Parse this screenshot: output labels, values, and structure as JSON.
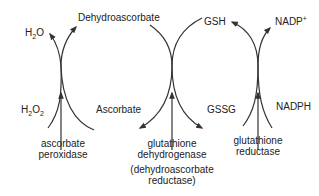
{
  "diagram": {
    "type": "coupled redox cycles",
    "compounds": {
      "h2o": {
        "text": "H",
        "sub": "2",
        "rest": "O"
      },
      "h2o2": {
        "text": "H",
        "sub1": "2",
        "mid": "O",
        "sub2": "2"
      },
      "dehydroascorbate": "Dehydroascorbate",
      "ascorbate": "Ascorbate",
      "gsh": "GSH",
      "gssg": "GSSG",
      "nadp_plus": {
        "text": "NADP",
        "sup": "+"
      },
      "nadph": "NADPH"
    },
    "enzymes": {
      "ascorbate_peroxidase": [
        "ascorbate",
        "peroxidase"
      ],
      "glutathione_dehydrogenase": [
        "glutathione",
        "dehydrogenase"
      ],
      "alt_name": [
        "(dehydroascorbate",
        "reductase)"
      ],
      "glutathione_reductase": [
        "glutathione",
        "reductase"
      ]
    },
    "colors": {
      "line": "#333333",
      "text": "#222222",
      "background": "#ffffff"
    }
  }
}
